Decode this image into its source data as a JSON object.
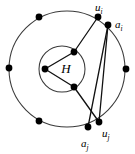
{
  "figure": {
    "name": "nested-circles-graph-diagram",
    "background_color": "#ffffff",
    "stroke_color": "#111111",
    "circle_stroke_color": "#3a3a3a",
    "node_color": "#000000",
    "labels": {
      "center": "H",
      "u_i": {
        "base": "u",
        "sub": "i"
      },
      "a_i": {
        "base": "a",
        "sub": "i"
      },
      "u_j": {
        "base": "u",
        "sub": "j"
      },
      "a_j": {
        "base": "a",
        "sub": "j"
      }
    },
    "circles": [
      {
        "id": "outer-circle",
        "cx": 67,
        "cy": 69,
        "r": 58
      },
      {
        "id": "inner-circle",
        "cx": 62,
        "cy": 69,
        "r": 23
      }
    ],
    "nodes": [
      {
        "id": "node-outer-left",
        "cx": 9,
        "cy": 68,
        "r": 3.4
      },
      {
        "id": "node-outer-top-left",
        "cx": 39,
        "cy": 17,
        "r": 3.4
      },
      {
        "id": "node-outer-bottom-left",
        "cx": 39,
        "cy": 121,
        "r": 3.4
      },
      {
        "id": "node-outer-right",
        "cx": 126,
        "cy": 69,
        "r": 3.4
      },
      {
        "id": "node-u-i",
        "cx": 98,
        "cy": 17,
        "r": 3.4
      },
      {
        "id": "node-a-i",
        "cx": 108,
        "cy": 25,
        "r": 3.4
      },
      {
        "id": "node-u-j",
        "cx": 99,
        "cy": 122,
        "r": 3.4
      },
      {
        "id": "node-a-j",
        "cx": 88,
        "cy": 127,
        "r": 3.4
      },
      {
        "id": "node-inner-left",
        "cx": 45,
        "cy": 69,
        "r": 3.4
      },
      {
        "id": "node-inner-top",
        "cx": 74,
        "cy": 52,
        "r": 3.4
      },
      {
        "id": "node-inner-bottom",
        "cx": 74,
        "cy": 87,
        "r": 3.4
      }
    ],
    "edges": [
      {
        "id": "edge-inner-left-to-inner-top",
        "x1": 45,
        "y1": 69,
        "x2": 74,
        "y2": 52
      },
      {
        "id": "edge-inner-left-to-inner-bottom",
        "x1": 45,
        "y1": 69,
        "x2": 74,
        "y2": 87
      },
      {
        "id": "edge-inner-top-to-u-i",
        "x1": 74,
        "y1": 52,
        "x2": 98,
        "y2": 17
      },
      {
        "id": "edge-inner-bottom-to-u-j",
        "x1": 74,
        "y1": 87,
        "x2": 99,
        "y2": 122
      },
      {
        "id": "edge-a-i-to-a-j",
        "x1": 108,
        "y1": 25,
        "x2": 88,
        "y2": 127
      },
      {
        "id": "edge-a-i-to-u-j",
        "x1": 108,
        "y1": 25,
        "x2": 99,
        "y2": 122
      }
    ],
    "label_positions": {
      "center": {
        "x": 66,
        "y": 70,
        "size": 13
      },
      "u_i": {
        "x": 95,
        "y": 7,
        "size": 11
      },
      "a_i": {
        "x": 116,
        "y": 23,
        "size": 11
      },
      "u_j": {
        "x": 102,
        "y": 135,
        "size": 11
      },
      "a_j": {
        "x": 82,
        "y": 146,
        "size": 11
      }
    }
  }
}
